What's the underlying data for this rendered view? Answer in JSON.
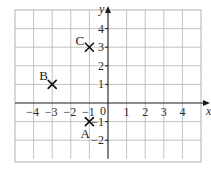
{
  "diagram": {
    "type": "coordinate-grid",
    "x_axis": {
      "label": "x",
      "min": -5,
      "max": 5,
      "tick_labels": [
        "-4",
        "-3",
        "-2",
        "-1",
        "1",
        "2",
        "3",
        "4"
      ],
      "tick_values": [
        -4,
        -3,
        -2,
        -1,
        1,
        2,
        3,
        4
      ]
    },
    "y_axis": {
      "label": "y",
      "min": -3,
      "max": 5,
      "tick_labels": [
        "4",
        "3",
        "2",
        "1",
        "-1",
        "-2"
      ],
      "tick_values": [
        4,
        3,
        2,
        1,
        -1,
        -2
      ]
    },
    "origin_label": "0",
    "points": [
      {
        "name": "A",
        "x": -1,
        "y": -1
      },
      {
        "name": "B",
        "x": -3,
        "y": 1
      },
      {
        "name": "C",
        "x": -1,
        "y": 3
      }
    ],
    "colors": {
      "grid": "#b4b4b4",
      "axis": "#1a1a1a",
      "marker": "#111111"
    }
  },
  "chart_data": {
    "type": "scatter",
    "title": "",
    "xlabel": "x",
    "ylabel": "y",
    "xlim": [
      -5,
      5
    ],
    "ylim": [
      -3,
      5
    ],
    "grid": true,
    "series": [
      {
        "name": "points",
        "labels": [
          "A",
          "B",
          "C"
        ],
        "x": [
          -1,
          -3,
          -1
        ],
        "y": [
          -1,
          1,
          3
        ]
      }
    ]
  }
}
